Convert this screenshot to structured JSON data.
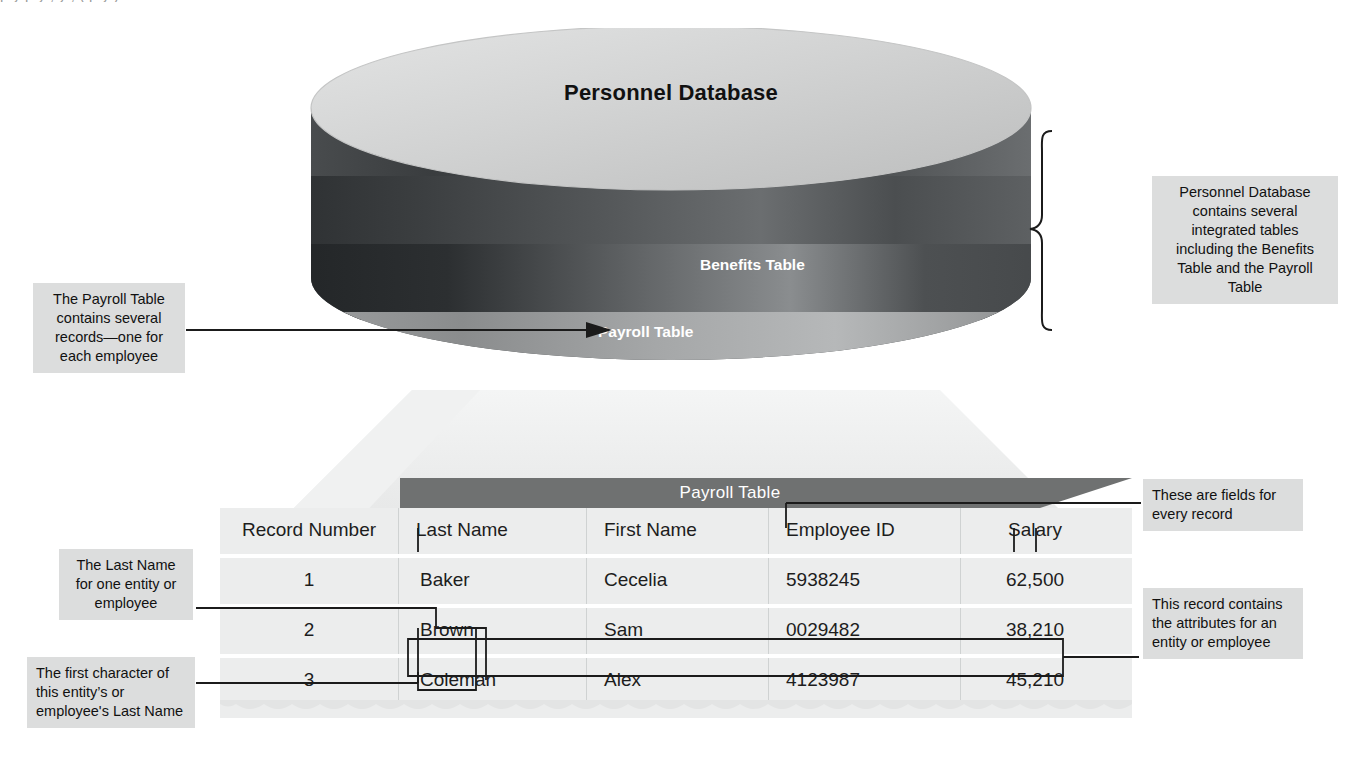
{
  "figure": {
    "top_cutoff_text": "p y          p y      ,  y , (    p y )",
    "database": {
      "title": "Personnel Database",
      "bands": [
        {
          "name": "benefits",
          "label": "Benefits Table"
        },
        {
          "name": "payroll",
          "label": "Payroll Table"
        }
      ]
    },
    "table": {
      "header": "Payroll Table",
      "columns": [
        "Record Number",
        "Last Name",
        "First Name",
        "Employee ID",
        "Salary"
      ],
      "rows": [
        {
          "record": "1",
          "last": "Baker",
          "first": "Cecelia",
          "id": "5938245",
          "salary": "62,500"
        },
        {
          "record": "2",
          "last": "Brown",
          "first": "Sam",
          "id": "0029482",
          "salary": "38,210"
        },
        {
          "record": "3",
          "last": "Coleman",
          "first": "Alex",
          "id": "4123987",
          "salary": "45,210"
        }
      ]
    },
    "callouts": {
      "payroll_records": "The Payroll Table contains several records—one for each employee",
      "personnel_db": "Personnel Database contains several integrated tables including the Benefits Table and the Payroll Table",
      "last_name_entity": "The Last Name for one  entity or employee",
      "first_character": "The first character of this entity’s or employee's Last Name",
      "fields_every_record": "These are fields for every record",
      "record_attributes": "This record contains the attributes for an entity or employee"
    },
    "colors": {
      "callout_bg": "#dcdddd",
      "table_bg": "#eceded",
      "header_bar": "#6f7171",
      "cyl_top": "#cfd0d0",
      "cyl_dark": "#3c3f41",
      "line": "#1b1b1b"
    }
  }
}
